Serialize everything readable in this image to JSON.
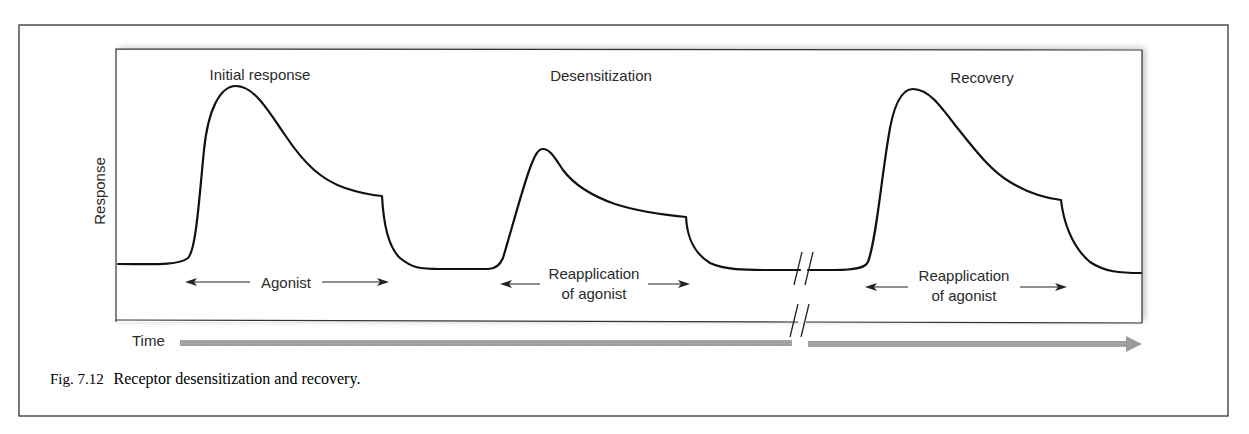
{
  "figure": {
    "caption_label": "Fig. 7.12",
    "caption_text": "Receptor desensitization and recovery.",
    "y_axis_label": "Response",
    "x_axis_label": "Time",
    "phases": [
      {
        "title": "Initial response",
        "stimulus_line1": "Agonist",
        "stimulus_line2": ""
      },
      {
        "title": "Desensitization",
        "stimulus_line1": "Reapplication",
        "stimulus_line2": "of agonist"
      },
      {
        "title": "Recovery",
        "stimulus_line1": "Reapplication",
        "stimulus_line2": "of agonist"
      }
    ],
    "time_break_symbol": "//",
    "colors": {
      "line": "#111111",
      "frame": "#333333",
      "time_arrow": "#9a9a9a",
      "text": "#2a2a2a"
    }
  }
}
